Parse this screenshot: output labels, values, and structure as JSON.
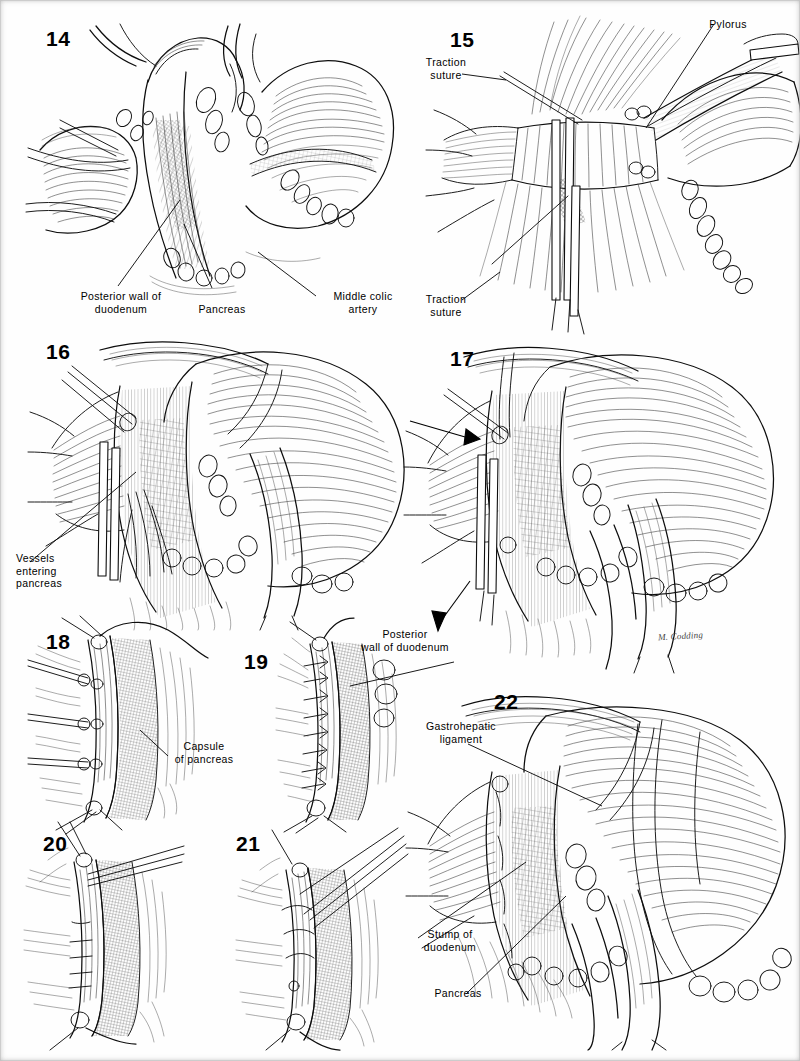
{
  "plate": {
    "kind": "surgical-illustration-plate",
    "artist_signature": "M. Codding",
    "background_color": "#fefefe",
    "ink_color": "#111111"
  },
  "figures": [
    {
      "id": "fig14",
      "number": "14",
      "labels": [
        {
          "id": "f14-l1",
          "text": "Posterior wall of\nduodenum",
          "align": "center"
        },
        {
          "id": "f14-l2",
          "text": "Pancreas",
          "align": "center"
        },
        {
          "id": "f14-l3",
          "text": "Middle colic\nartery",
          "align": "center"
        }
      ]
    },
    {
      "id": "fig15",
      "number": "15",
      "labels": [
        {
          "id": "f15-l1",
          "text": "Pylorus",
          "align": "center"
        },
        {
          "id": "f15-l2",
          "text": "Traction\nsuture",
          "align": "center"
        },
        {
          "id": "f15-l3",
          "text": "Traction\nsuture",
          "align": "center"
        }
      ]
    },
    {
      "id": "fig16",
      "number": "16",
      "labels": [
        {
          "id": "f16-l1",
          "text": "Vessels\nentering\npancreas",
          "align": "left"
        }
      ]
    },
    {
      "id": "fig17",
      "number": "17",
      "labels": []
    },
    {
      "id": "fig18",
      "number": "18",
      "labels": [
        {
          "id": "f18-l1",
          "text": "Capsule\nof pancreas",
          "align": "center"
        }
      ]
    },
    {
      "id": "fig19",
      "number": "19",
      "labels": [
        {
          "id": "f19-l1",
          "text": "Posterior\nwall of duodenum",
          "align": "center"
        }
      ]
    },
    {
      "id": "fig20",
      "number": "20",
      "labels": []
    },
    {
      "id": "fig21",
      "number": "21",
      "labels": []
    },
    {
      "id": "fig22",
      "number": "22",
      "labels": [
        {
          "id": "f22-l1",
          "text": "Gastrohepatic\nligament",
          "align": "center"
        },
        {
          "id": "f22-l2",
          "text": "Stump of\nduodenum",
          "align": "center"
        },
        {
          "id": "f22-l3",
          "text": "Pancreas",
          "align": "center"
        }
      ]
    }
  ]
}
